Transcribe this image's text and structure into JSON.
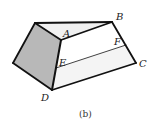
{
  "figure": {
    "caption": "(b)",
    "colors": {
      "edge": "#111111",
      "shaded_face": "#b8b8b8",
      "light_face": "#ececec",
      "background": "#ffffff"
    },
    "labels": {
      "A": "A",
      "B": "B",
      "C": "C",
      "D": "D",
      "E": "E",
      "F": "F"
    }
  }
}
